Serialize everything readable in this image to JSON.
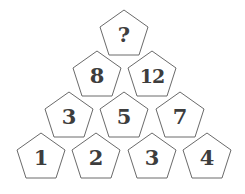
{
  "puzzle": {
    "shape": "pentagon",
    "stroke_color": "#6a6a6a",
    "fill_color": "#ffffff",
    "text_color": "#3d3d3d",
    "rows": [
      [
        "?"
      ],
      [
        "8",
        "12"
      ],
      [
        "3",
        "5",
        "7"
      ],
      [
        "1",
        "2",
        "3",
        "4"
      ]
    ]
  }
}
